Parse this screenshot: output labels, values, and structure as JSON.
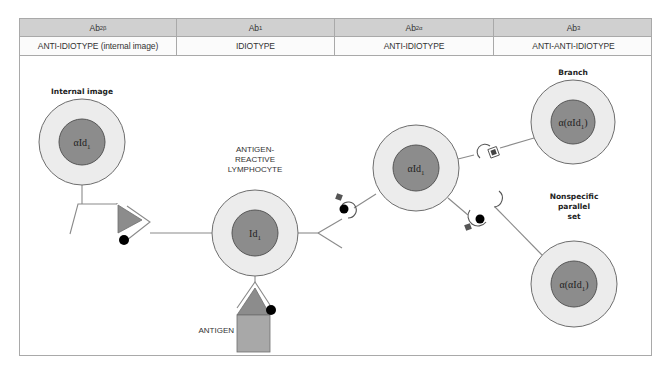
{
  "header": {
    "columns": [
      {
        "name": "Ab",
        "sub": "2β",
        "role": "ANTI-IDIOTYPE (internal image)",
        "width": 157
      },
      {
        "name": "Ab",
        "sub": "1",
        "role": "IDIOTYPE",
        "width": 158
      },
      {
        "name": "Ab",
        "sub": "2α",
        "role": "ANTI-IDIOTYPE",
        "width": 159
      },
      {
        "name": "Ab",
        "sub": "3",
        "role": "ANTI-ANTI-IDIOTYPE",
        "width": 159
      }
    ]
  },
  "diagram": {
    "colors": {
      "outer_fill": "#ececec",
      "inner_fill": "#8c8c8c",
      "stroke": "#6e6e6e",
      "line": "#8a8a8a",
      "dot": "#000000",
      "square": "#555555",
      "antigen_fill": "#a8a8a8"
    },
    "cells": [
      {
        "id": "internal-image",
        "label": "Internal image",
        "inner_text": "αId",
        "inner_sub": "1",
        "cx": 82,
        "cy": 142
      },
      {
        "id": "antigen-reactive-lymphocyte",
        "label_lines": [
          "ANTIGEN-",
          "REACTIVE",
          "LYMPHOCYTE"
        ],
        "inner_text": "Id",
        "inner_sub": "1",
        "cx": 255,
        "cy": 233
      },
      {
        "id": "anti-idiotype",
        "inner_text": "αId",
        "inner_sub": "1",
        "cx": 416,
        "cy": 168
      },
      {
        "id": "branch",
        "label": "Branch",
        "inner_text": "α(αId",
        "inner_sub": "1",
        "inner_close": ")",
        "cx": 573,
        "cy": 122
      },
      {
        "id": "nonspecific-parallel-set",
        "label_lines": [
          "Nonspecific",
          "parallel",
          "set"
        ],
        "inner_text": "α(αId",
        "inner_sub": "1",
        "inner_close": ")",
        "cx": 574,
        "cy": 284
      }
    ],
    "antigen_label": "ANTIGEN"
  }
}
